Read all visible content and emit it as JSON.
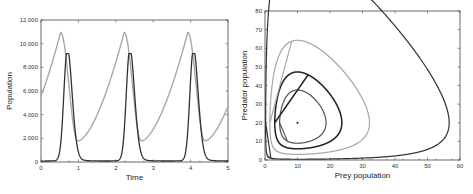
{
  "chart_data": [
    {
      "type": "line",
      "title": "",
      "xlabel": "Time",
      "ylabel": "Population",
      "xlim": [
        0,
        5
      ],
      "ylim": [
        0,
        12000
      ],
      "xticks": [
        "0",
        "1",
        "2",
        "3",
        "4",
        "5"
      ],
      "yticks": [
        "0",
        "2,000",
        "4,000",
        "6,000",
        "8,000",
        "10,000",
        "12,000"
      ],
      "grid": false,
      "series": [
        {
          "name": "Prey",
          "color": "#a8a8a8",
          "x": [
            0,
            0.25,
            0.45,
            0.5,
            0.6,
            0.75,
            1.0,
            1.3,
            1.7,
            2.0,
            2.2,
            2.4,
            2.7,
            3.0,
            3.5,
            3.9,
            4.1,
            4.4,
            4.7,
            5.0
          ],
          "values": [
            5200,
            8500,
            10900,
            10950,
            8000,
            3000,
            1800,
            2400,
            5200,
            8800,
            10950,
            6000,
            1850,
            2300,
            5800,
            10950,
            6500,
            1850,
            2700,
            4000
          ]
        },
        {
          "name": "Predator",
          "color": "#333333",
          "x": [
            0,
            0.3,
            0.5,
            0.6,
            0.7,
            0.8,
            0.9,
            1.1,
            1.4,
            1.8,
            2.1,
            2.25,
            2.37,
            2.5,
            2.7,
            3.0,
            3.5,
            3.85,
            3.95,
            4.07,
            4.2,
            4.5,
            5.0
          ],
          "values": [
            100,
            300,
            2000,
            6500,
            9100,
            7000,
            3500,
            900,
            200,
            100,
            600,
            4000,
            9000,
            6000,
            1500,
            300,
            100,
            800,
            4500,
            9100,
            6000,
            1200,
            100
          ]
        }
      ]
    },
    {
      "type": "line",
      "title": "",
      "xlabel": "Prey population",
      "ylabel": "Predator population",
      "xlim": [
        0,
        60
      ],
      "ylim": [
        0,
        80
      ],
      "xticks": [
        "0",
        "10",
        "20",
        "30",
        "40",
        "50",
        "60"
      ],
      "yticks": [
        "0",
        "10",
        "20",
        "30",
        "40",
        "50",
        "60",
        "70",
        "80"
      ],
      "grid": false,
      "equilibrium_point": {
        "x": 10,
        "y": 20
      },
      "series": [
        {
          "name": "Orbit 1 (innermost)",
          "color": "#555555",
          "xrange": [
            4.5,
            18.5
          ],
          "yrange": [
            11,
            31.5
          ]
        },
        {
          "name": "Orbit 2",
          "color": "#222222",
          "xrange": [
            3,
            24
          ],
          "yrange": [
            8.5,
            38
          ]
        },
        {
          "name": "Orbit 3",
          "color": "#a8a8a8",
          "xrange": [
            1.5,
            35
          ],
          "yrange": [
            5,
            51
          ]
        },
        {
          "name": "Orbit 4 (outermost)",
          "color": "#333333",
          "xrange": [
            0.2,
            58.5
          ],
          "yrange": [
            1.5,
            77
          ]
        }
      ]
    }
  ]
}
